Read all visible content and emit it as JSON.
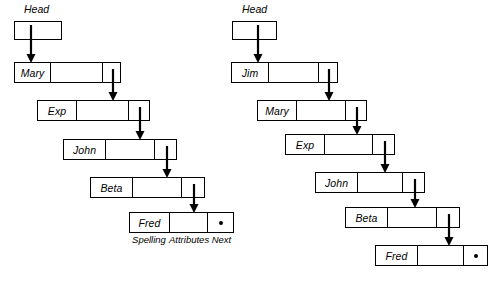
{
  "diagram": {
    "width": 495,
    "height": 283,
    "stroke_color": "#000000",
    "background_color": "#ffffff",
    "null_marker": "•"
  },
  "lists": [
    {
      "id": "left-list",
      "head": {
        "label": "Head",
        "label_x": 24,
        "label_y": 3,
        "box_x": 14,
        "box_y": 21,
        "box_w": 48,
        "box_h": 19,
        "pointer_x": 31
      },
      "nodes": [
        {
          "spelling": "Mary",
          "x": 14,
          "y": 62,
          "w": 107,
          "spelling_w": 36,
          "next_w": 17
        },
        {
          "spelling": "Exp",
          "x": 37,
          "y": 100,
          "w": 113,
          "spelling_w": 39,
          "next_w": 20
        },
        {
          "spelling": "John",
          "x": 63,
          "y": 139,
          "w": 114,
          "spelling_w": 42,
          "next_w": 21
        },
        {
          "spelling": "Beta",
          "x": 90,
          "y": 177,
          "w": 115,
          "spelling_w": 42,
          "next_w": 22
        },
        {
          "spelling": "Fred",
          "x": 129,
          "y": 212,
          "w": 105,
          "spelling_w": 40,
          "next_w": 25,
          "next_is_null": true
        }
      ],
      "legend": [
        {
          "text": "Spelling",
          "x": 129,
          "w": 40
        },
        {
          "text": "Attributes",
          "x": 169,
          "w": 40
        },
        {
          "text": "Next",
          "x": 209,
          "w": 25
        }
      ],
      "legend_y": 234
    },
    {
      "id": "right-list",
      "head": {
        "label": "Head",
        "label_x": 242,
        "label_y": 3,
        "box_x": 232,
        "box_y": 21,
        "box_w": 45,
        "box_h": 19,
        "pointer_x": 258
      },
      "nodes": [
        {
          "spelling": "Jim",
          "x": 231,
          "y": 62,
          "w": 107,
          "spelling_w": 37,
          "next_w": 18
        },
        {
          "spelling": "Mary",
          "x": 257,
          "y": 100,
          "w": 110,
          "spelling_w": 39,
          "next_w": 20
        },
        {
          "spelling": "Exp",
          "x": 285,
          "y": 134,
          "w": 110,
          "spelling_w": 39,
          "next_w": 21
        },
        {
          "spelling": "John",
          "x": 315,
          "y": 172,
          "w": 110,
          "spelling_w": 42,
          "next_w": 21
        },
        {
          "spelling": "Beta",
          "x": 345,
          "y": 207,
          "w": 115,
          "spelling_w": 42,
          "next_w": 22
        },
        {
          "spelling": "Fred",
          "x": 375,
          "y": 245,
          "w": 113,
          "spelling_w": 42,
          "next_w": 23,
          "next_is_null": true
        }
      ],
      "legend": [],
      "legend_y": 0
    }
  ]
}
